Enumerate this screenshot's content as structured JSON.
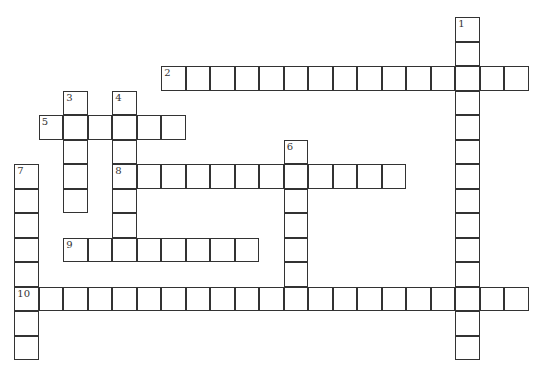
{
  "puzzle": {
    "type": "crossword",
    "cell_size": 24.5,
    "origin": {
      "x": 15,
      "y": 18
    },
    "entries": [
      {
        "number": "1",
        "direction": "down",
        "row": 0,
        "col": 18,
        "length": 14
      },
      {
        "number": "2",
        "direction": "across",
        "row": 2,
        "col": 6,
        "length": 15
      },
      {
        "number": "3",
        "direction": "down",
        "row": 3,
        "col": 2,
        "length": 5
      },
      {
        "number": "4",
        "direction": "down",
        "row": 3,
        "col": 4,
        "length": 7
      },
      {
        "number": "5",
        "direction": "across",
        "row": 4,
        "col": 1,
        "length": 6
      },
      {
        "number": "6",
        "direction": "down",
        "row": 5,
        "col": 11,
        "length": 7
      },
      {
        "number": "7",
        "direction": "down",
        "row": 6,
        "col": 0,
        "length": 8
      },
      {
        "number": "8",
        "direction": "across",
        "row": 6,
        "col": 4,
        "length": 12
      },
      {
        "number": "9",
        "direction": "across",
        "row": 9,
        "col": 2,
        "length": 8
      },
      {
        "number": "10",
        "direction": "across",
        "row": 11,
        "col": 0,
        "length": 21
      }
    ]
  }
}
